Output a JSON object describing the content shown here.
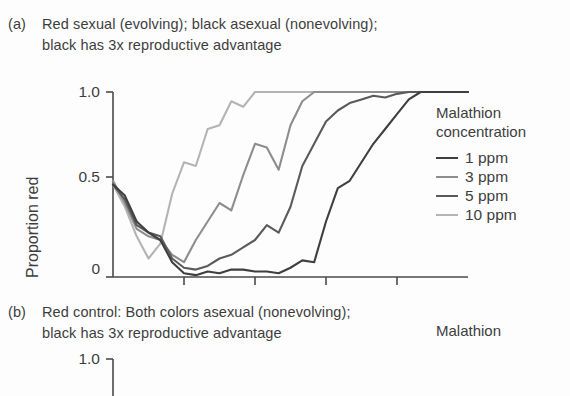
{
  "figure": {
    "background": "#fdfdfd",
    "axis_color": "#4a4a4a"
  },
  "panels": [
    {
      "key": "a",
      "label": "(a)",
      "caption_line1": "Red sexual (evolving); black asexual (nonevolving);",
      "caption_line2": "black has 3x reproductive advantage",
      "ylabel": "Proportion red",
      "yticks": [
        "1.0",
        "0.5",
        "0"
      ],
      "legend": {
        "title_line1": "Malathion",
        "title_line2": "concentration",
        "entries": [
          {
            "label": "1 ppm",
            "color": "#3f3f3f"
          },
          {
            "label": "3 ppm",
            "color": "#8d8d8d"
          },
          {
            "label": "5 ppm",
            "color": "#5a5a5a"
          },
          {
            "label": "10 ppm",
            "color": "#b4b4b4"
          }
        ]
      }
    },
    {
      "key": "b",
      "label": "(b)",
      "caption_line1": "Red control: Both colors asexual (nonevolving);",
      "caption_line2": "black has 3x reproductive advantage",
      "yticks": [
        "1.0"
      ],
      "legend": {
        "title_line1": "Malathion"
      }
    }
  ],
  "chart_data": {
    "type": "line",
    "title": "Red sexual (evolving); black asexual (nonevolving); black has 3x reproductive advantage",
    "xlabel": "",
    "ylabel": "Proportion red",
    "ylim": [
      0,
      1
    ],
    "yticks": [
      0,
      0.5,
      1.0
    ],
    "xlim": [
      0,
      60
    ],
    "xticks": [
      12,
      24,
      36,
      48
    ],
    "grid": false,
    "legend_position": "right",
    "legend_title": "Malathion concentration",
    "series": [
      {
        "name": "10 ppm",
        "color": "#b4b4b4",
        "x": [
          0,
          2,
          4,
          6,
          8,
          10,
          12,
          14,
          16,
          18,
          20,
          22,
          24,
          26,
          28,
          30,
          32,
          34,
          36,
          38,
          40,
          42,
          44,
          46,
          48,
          50,
          52,
          54,
          56,
          58,
          60
        ],
        "values": [
          0.5,
          0.38,
          0.22,
          0.1,
          0.18,
          0.45,
          0.62,
          0.6,
          0.8,
          0.82,
          0.95,
          0.92,
          1.0,
          1.0,
          1.0,
          1.0,
          1.0,
          1.0,
          1.0,
          1.0,
          1.0,
          1.0,
          1.0,
          1.0,
          1.0,
          1.0,
          1.0,
          1.0,
          1.0,
          1.0,
          1.0
        ]
      },
      {
        "name": "3 ppm",
        "color": "#8d8d8d",
        "x": [
          0,
          2,
          4,
          6,
          8,
          10,
          12,
          14,
          16,
          18,
          20,
          22,
          24,
          26,
          28,
          30,
          32,
          34,
          36,
          38,
          40,
          42,
          44,
          46,
          48,
          50,
          52,
          54,
          56,
          58,
          60
        ],
        "values": [
          0.52,
          0.4,
          0.26,
          0.22,
          0.2,
          0.12,
          0.08,
          0.2,
          0.3,
          0.4,
          0.36,
          0.55,
          0.72,
          0.7,
          0.58,
          0.82,
          0.95,
          1.0,
          1.0,
          1.0,
          1.0,
          1.0,
          1.0,
          1.0,
          1.0,
          1.0,
          1.0,
          1.0,
          1.0,
          1.0,
          1.0
        ]
      },
      {
        "name": "5 ppm",
        "color": "#5a5a5a",
        "x": [
          0,
          2,
          4,
          6,
          8,
          10,
          12,
          14,
          16,
          18,
          20,
          22,
          24,
          26,
          28,
          30,
          32,
          34,
          36,
          38,
          40,
          42,
          44,
          46,
          48,
          50,
          52,
          54,
          56,
          58,
          60
        ],
        "values": [
          0.5,
          0.42,
          0.28,
          0.24,
          0.22,
          0.1,
          0.05,
          0.04,
          0.06,
          0.1,
          0.12,
          0.16,
          0.2,
          0.28,
          0.24,
          0.38,
          0.6,
          0.72,
          0.84,
          0.9,
          0.94,
          0.96,
          0.98,
          0.97,
          0.99,
          1.0,
          1.0,
          1.0,
          1.0,
          1.0,
          1.0
        ]
      },
      {
        "name": "1 ppm",
        "color": "#3f3f3f",
        "x": [
          0,
          2,
          4,
          6,
          8,
          10,
          12,
          14,
          16,
          18,
          20,
          22,
          24,
          26,
          28,
          30,
          32,
          34,
          36,
          38,
          40,
          42,
          44,
          46,
          48,
          50,
          52,
          54,
          56,
          58,
          60
        ],
        "values": [
          0.5,
          0.44,
          0.3,
          0.24,
          0.2,
          0.08,
          0.02,
          0.01,
          0.03,
          0.02,
          0.04,
          0.04,
          0.03,
          0.03,
          0.02,
          0.05,
          0.09,
          0.08,
          0.3,
          0.48,
          0.52,
          0.62,
          0.72,
          0.8,
          0.88,
          0.96,
          1.0,
          1.0,
          1.0,
          1.0,
          1.0
        ]
      }
    ]
  }
}
